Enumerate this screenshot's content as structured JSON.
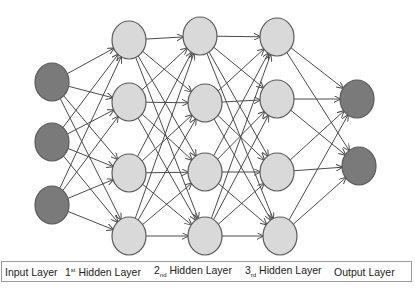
{
  "diagram": {
    "colors": {
      "input_node": "#7a7a7a",
      "hidden_node": "#d9d9d9",
      "output_node": "#7a7a7a",
      "node_stroke": "#5a5a5a",
      "edge": "#4a4a4a"
    },
    "layers": [
      {
        "name": "Input Layer",
        "type": "input",
        "nodes": [
          [
            52,
            82
          ],
          [
            52,
            142
          ],
          [
            52,
            205
          ]
        ]
      },
      {
        "name": "1st Hidden Layer",
        "type": "hidden",
        "nodes": [
          [
            129,
            40
          ],
          [
            129,
            102
          ],
          [
            129,
            173
          ],
          [
            129,
            236
          ]
        ]
      },
      {
        "name": "2nd Hidden Layer",
        "type": "hidden",
        "nodes": [
          [
            200,
            36
          ],
          [
            205,
            103
          ],
          [
            205,
            172
          ],
          [
            205,
            236
          ]
        ]
      },
      {
        "name": "3rd Hidden Layer",
        "type": "hidden",
        "nodes": [
          [
            277,
            37
          ],
          [
            277,
            99
          ],
          [
            277,
            172
          ],
          [
            280,
            236
          ]
        ]
      },
      {
        "name": "Output Layer",
        "type": "output",
        "nodes": [
          [
            357,
            99
          ],
          [
            359,
            166
          ]
        ]
      }
    ],
    "node_rx": 17,
    "node_ry": 19,
    "connectivity": "fully-connected"
  },
  "labels": [
    {
      "text": "Input Layer",
      "x": 3
    },
    {
      "prefix": "1",
      "ordinal": "st",
      "ordinal_style": "sup",
      "text": " Hidden Layer",
      "x": 63
    },
    {
      "prefix": "2",
      "ordinal": "nd",
      "ordinal_style": "sub",
      "text": " Hidden Layer",
      "x": 152
    },
    {
      "prefix": "3",
      "ordinal": "rd",
      "ordinal_style": "sub",
      "text": " Hidden Layer",
      "x": 243
    },
    {
      "text": "Output Layer",
      "x": 332
    }
  ]
}
